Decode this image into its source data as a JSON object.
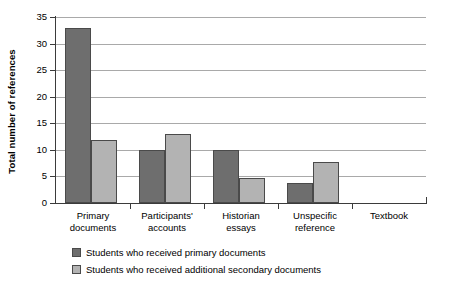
{
  "chart_data": {
    "type": "bar",
    "title": "",
    "xlabel": "",
    "ylabel": "Total number of references",
    "ylim": [
      0,
      35
    ],
    "ytick_step": 5,
    "yticks": [
      0,
      5,
      10,
      15,
      20,
      25,
      30,
      35
    ],
    "grid": true,
    "legend_position": "bottom",
    "categories": [
      "Primary\ndocuments",
      "Participants'\naccounts",
      "Historian\nessays",
      "Unspecific\nreference",
      "Textbook"
    ],
    "series": [
      {
        "name": "Students who received primary documents",
        "color": "#6e6e6e",
        "values": [
          33,
          10,
          10,
          3.8,
          0
        ]
      },
      {
        "name": "Students who received additional secondary documents",
        "color": "#b3b3b3",
        "values": [
          11.9,
          12.9,
          4.8,
          7.7,
          0
        ]
      }
    ]
  },
  "legend": {
    "items": [
      {
        "label": "Students who received primary documents"
      },
      {
        "label": "Students who received additional secondary documents"
      }
    ]
  },
  "colors": {
    "series0": "#6e6e6e",
    "series1": "#b3b3b3",
    "axis": "#3b3b3b",
    "gridline": "#a9a9a9",
    "background": "#ffffff"
  }
}
